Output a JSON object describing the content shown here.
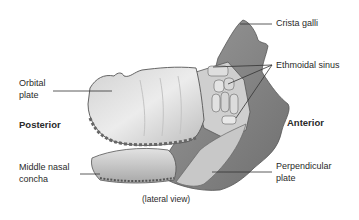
{
  "figure": {
    "caption": "(lateral view)",
    "orientation": {
      "left": "Posterior",
      "right": "Anterior"
    },
    "labels": {
      "crista_galli": "Crista galli",
      "ethmoidal_sinus": "Ethmoidal sinus",
      "orbital_plate_line1": "Orbital",
      "orbital_plate_line2": "plate",
      "middle_nasal_concha_line1": "Middle nasal",
      "middle_nasal_concha_line2": "concha",
      "perpendicular_plate_line1": "Perpendicular",
      "perpendicular_plate_line2": "plate"
    },
    "colors": {
      "bone_light": "#e6e6e6",
      "bone_mid": "#b9b9b9",
      "bone_dark": "#7d7d7d",
      "leader_line": "#333333"
    }
  }
}
